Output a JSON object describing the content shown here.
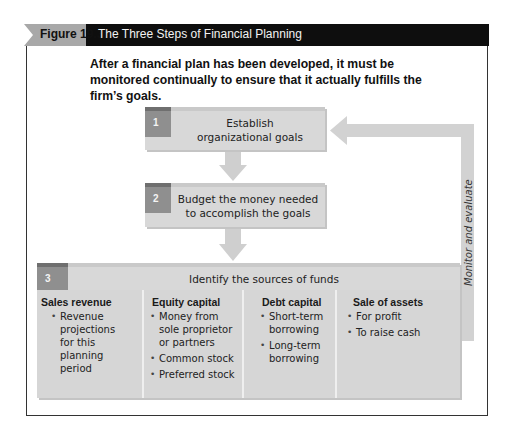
{
  "header": {
    "figure_label": "Figure 19.3",
    "title": "The Three Steps of Financial Planning"
  },
  "subtitle": "After a financial plan has been developed, it must be monitored continually to ensure that it actually fulfills the firm’s goals.",
  "steps": [
    {
      "number": "1",
      "text_line1": "Establish",
      "text_line2": "organizational goals"
    },
    {
      "number": "2",
      "text_line1": "Budget the money needed",
      "text_line2": "to accomplish the goals"
    },
    {
      "number": "3",
      "text": "Identify the sources of funds"
    }
  ],
  "sources": [
    {
      "title": "Sales revenue",
      "items": [
        "Revenue projections for this planning period"
      ]
    },
    {
      "title": "Equity capital",
      "items": [
        "Money from sole proprietor or partners",
        "Common stock",
        "Preferred stock"
      ]
    },
    {
      "title": "Debt capital",
      "items": [
        "Short-term borrowing",
        "Long-term borrowing"
      ]
    },
    {
      "title": "Sale of assets",
      "items": [
        "For profit",
        "To raise cash"
      ]
    }
  ],
  "feedback_loop": {
    "label": "Monitor and evaluate"
  },
  "colors": {
    "header_bar": "#0e0e0e",
    "header_tab": "#a8a8a8",
    "step_fill": "#d8d8d8",
    "badge_fill": "#8f8f8f",
    "arrow_fill": "#cfcfcf"
  }
}
